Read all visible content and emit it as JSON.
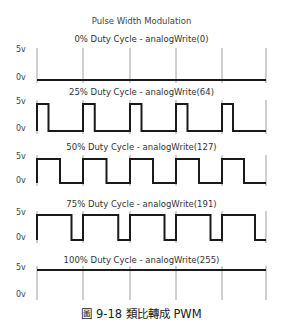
{
  "title": "Pulse Width Modulation",
  "labels": {
    "high": "5v",
    "low": "0v"
  },
  "caption": "圖 9-18  類比轉成 PWM",
  "grid_x": [
    37,
    83,
    130,
    176,
    222,
    266
  ],
  "rows": [
    {
      "label": "0% Duty Cycle - analogWrite(0)",
      "duty": 0,
      "title_y": 34,
      "top": 52,
      "bottom": 80
    },
    {
      "label": "25% Duty Cycle - analogWrite(64)",
      "duty": 0.25,
      "title_y": 87,
      "top": 104,
      "bottom": 131
    },
    {
      "label": "50% Duty Cycle - analogWrite(127)",
      "duty": 0.5,
      "title_y": 142,
      "top": 159,
      "bottom": 183
    },
    {
      "label": "75% Duty Cycle - analogWrite(191)",
      "duty": 0.75,
      "title_y": 199,
      "top": 215,
      "bottom": 240
    },
    {
      "label": "100% Duty Cycle - analogWrite(255)",
      "duty": 1,
      "title_y": 255,
      "top": 270,
      "bottom": 297
    }
  ],
  "chart_data": {
    "type": "line",
    "title": "Pulse Width Modulation",
    "xlabel": "",
    "ylabel": "Voltage",
    "y_levels": [
      "0v",
      "5v"
    ],
    "periods": 5,
    "series": [
      {
        "name": "0% Duty Cycle - analogWrite(0)",
        "duty_cycle_pct": 0,
        "analogWrite": 0
      },
      {
        "name": "25% Duty Cycle - analogWrite(64)",
        "duty_cycle_pct": 25,
        "analogWrite": 64
      },
      {
        "name": "50% Duty Cycle - analogWrite(127)",
        "duty_cycle_pct": 50,
        "analogWrite": 127
      },
      {
        "name": "75% Duty Cycle - analogWrite(191)",
        "duty_cycle_pct": 75,
        "analogWrite": 191
      },
      {
        "name": "100% Duty Cycle - analogWrite(255)",
        "duty_cycle_pct": 100,
        "analogWrite": 255
      }
    ]
  }
}
